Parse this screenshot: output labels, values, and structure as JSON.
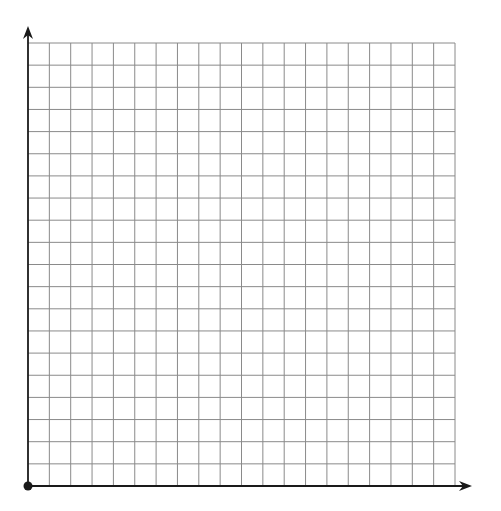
{
  "grid": {
    "columns": 20,
    "rows": 20,
    "origin_x": 28,
    "origin_y": 486,
    "right_x": 455,
    "top_y": 43,
    "line_color": "#8a8a8a",
    "axis_color": "#1a1a1a"
  },
  "axes": {
    "x_axis_end": 472,
    "y_axis_end": 26,
    "origin_dot_radius": 4.5
  }
}
